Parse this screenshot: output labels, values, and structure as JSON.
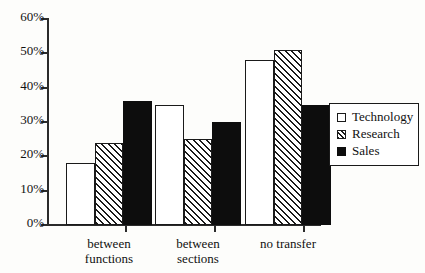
{
  "chart_data": {
    "type": "bar",
    "title": "",
    "subtitle": "",
    "xlabel": "",
    "ylabel": "",
    "categories": [
      "between functions",
      "between sections",
      "no transfer"
    ],
    "category_lines": [
      [
        "between",
        "functions"
      ],
      [
        "between",
        "sections"
      ],
      [
        "no transfer",
        ""
      ]
    ],
    "series": [
      {
        "name": "Technology",
        "values": [
          18,
          35,
          48
        ],
        "fill": "white",
        "color": "#ffffff"
      },
      {
        "name": "Research",
        "values": [
          24,
          25,
          51
        ],
        "fill": "hatched",
        "color": "#1a1a1a"
      },
      {
        "name": "Sales",
        "values": [
          36,
          30,
          35
        ],
        "fill": "solid",
        "color": "#0d0d0d"
      }
    ],
    "ylim": [
      0,
      60
    ],
    "ytick_values": [
      60,
      50,
      40,
      30,
      20,
      10,
      0
    ],
    "ytick_labels": [
      "60%",
      "50%",
      "40%",
      "30%",
      "20%",
      "10%",
      "0%"
    ],
    "grid": false,
    "legend_position": "right",
    "axis_color": "#2b2b2b",
    "background_color": "#fdfdfb"
  },
  "legend": {
    "entries": [
      {
        "label": "Technology"
      },
      {
        "label": "Research"
      },
      {
        "label": "Sales"
      }
    ]
  }
}
